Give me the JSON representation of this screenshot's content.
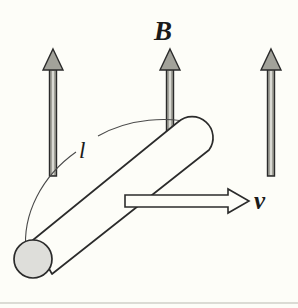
{
  "figure": {
    "background_color": "#fdfdf8",
    "stroke_color": "#2b2b2b",
    "labels": {
      "magnetic_field": "B",
      "velocity": "v",
      "length": "l"
    },
    "field_arrows": {
      "count": 3,
      "direction": "up",
      "fill_color": "#9a9a93",
      "outline_color": "#2b2b2b",
      "positions_x": [
        53,
        170,
        271
      ],
      "shaft_top_y": 68,
      "shaft_bottom_y": 176,
      "head_tip_y": 49
    },
    "velocity_arrow": {
      "direction": "right",
      "fill_color": "#ffffff",
      "outline_color": "#2b2b2b",
      "start_x": 125,
      "end_x": 248,
      "y": 201
    },
    "rod": {
      "shape": "cylinder",
      "end_cap_fill": "#ddddd5",
      "outline_color": "#2b2b2b",
      "bottom_end_center": [
        33,
        259
      ],
      "bottom_end_radius": 19,
      "top_end_center": [
        196,
        137
      ]
    },
    "length_leader": {
      "style": "thin-arc",
      "label": "l",
      "from": [
        26,
        250
      ],
      "to": [
        198,
        124
      ]
    }
  }
}
